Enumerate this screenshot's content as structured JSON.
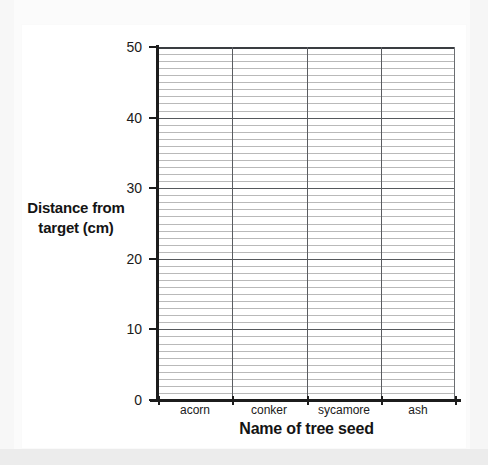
{
  "page": {
    "background_color": "#f2f2f2",
    "card_color": "#ffffff"
  },
  "chart_data": {
    "type": "bar",
    "title": "",
    "subtitle": "",
    "xlabel": "Name of tree seed",
    "ylabel": "Distance from target (cm)",
    "ylabel_line1": "Distance from",
    "ylabel_line2": "target (cm)",
    "categories": [
      "acorn",
      "conker",
      "sycamore",
      "ash"
    ],
    "values": [
      null,
      null,
      null,
      null
    ],
    "series": [
      {
        "name": "Distance from target (cm)",
        "values": [
          null,
          null,
          null,
          null
        ]
      }
    ],
    "ylim": [
      0,
      50
    ],
    "y_major_ticks": [
      0,
      10,
      20,
      30,
      40,
      50
    ],
    "y_tick_labels": [
      "0",
      "10",
      "20",
      "30",
      "40",
      "50"
    ],
    "y_minor_step": 1,
    "grid": "horizontal-major-and-minor, vertical-category-dividers",
    "legend": "none",
    "note": "Blank axes template — no data bars are plotted",
    "colors": {
      "axis": "#1c1c1c",
      "gridline_major": "#55585c",
      "gridline_minor": "#b9b9b9",
      "category_divider": "#5a5d61",
      "text": "#141414",
      "plot_background": "#ffffff"
    }
  },
  "axis": {
    "y_title": "Distance from target (cm)",
    "x_title": "Name of tree seed"
  }
}
